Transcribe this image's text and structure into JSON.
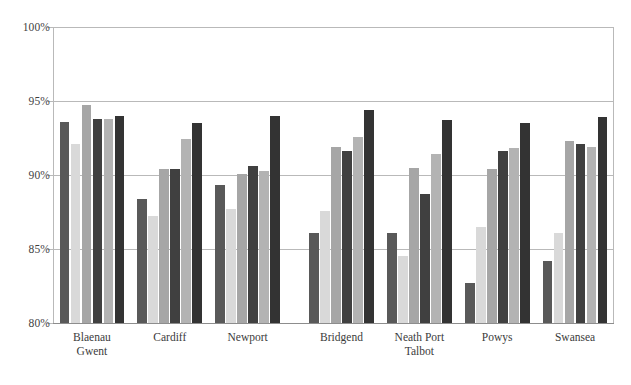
{
  "chart_data": {
    "type": "bar",
    "title": "",
    "xlabel": "",
    "ylabel": "",
    "ylim": [
      80,
      100
    ],
    "ytick_values": [
      80,
      85,
      90,
      95,
      100
    ],
    "ytick_labels": [
      "80%",
      "85%",
      "90%",
      "95%",
      "100%"
    ],
    "grid": true,
    "grid_axis": "y",
    "legend": "none",
    "categories": [
      "Blaenau\nGwent",
      "Cardiff",
      "Newport",
      "Bridgend",
      "Neath Port\nTalbot",
      "Powys",
      "Swansea"
    ],
    "group_gap_after_index": 2,
    "series": [
      {
        "name": "series-1",
        "color": "#595959",
        "values": [
          93.6,
          88.4,
          89.3,
          86.1,
          86.1,
          82.7,
          84.2
        ]
      },
      {
        "name": "series-2",
        "color": "#d9d9d9",
        "values": [
          92.1,
          87.2,
          87.7,
          87.6,
          84.5,
          86.5,
          86.1
        ]
      },
      {
        "name": "series-3",
        "color": "#a6a6a6",
        "values": [
          94.7,
          90.4,
          90.1,
          91.9,
          90.5,
          90.4,
          92.3
        ]
      },
      {
        "name": "series-4",
        "color": "#404040",
        "values": [
          93.8,
          90.4,
          90.6,
          91.6,
          88.7,
          91.6,
          92.1
        ]
      },
      {
        "name": "series-5",
        "color": "#b3b3b3",
        "values": [
          93.8,
          92.4,
          90.3,
          92.6,
          91.4,
          91.8,
          91.9
        ]
      },
      {
        "name": "series-6",
        "color": "#333333",
        "values": [
          94.0,
          93.5,
          94.0,
          94.4,
          93.7,
          93.5,
          93.9
        ]
      }
    ]
  },
  "axis": {
    "axis_line_color": "#b9b9b9",
    "baseline_color": "#8d8d8d",
    "tick_label_color": "#3f3f3f",
    "category_label_color": "#3b3b3b"
  }
}
